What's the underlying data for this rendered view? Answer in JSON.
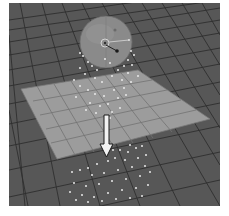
{
  "scene": {
    "viewport": {
      "background": "#575757",
      "grid_line": "#2e2e2e"
    },
    "emitter": {
      "type": "sphere",
      "color": "#8a8a8a",
      "highlight": "#9e9e9e"
    },
    "collision_plane": {
      "color": "#9a9a9a",
      "line": "#6a6a6a"
    },
    "arrow": {
      "direction": "down",
      "fill": "#f2f2f2",
      "stroke": "#1a1a1a"
    },
    "particle_color": "#e8e8e8"
  }
}
